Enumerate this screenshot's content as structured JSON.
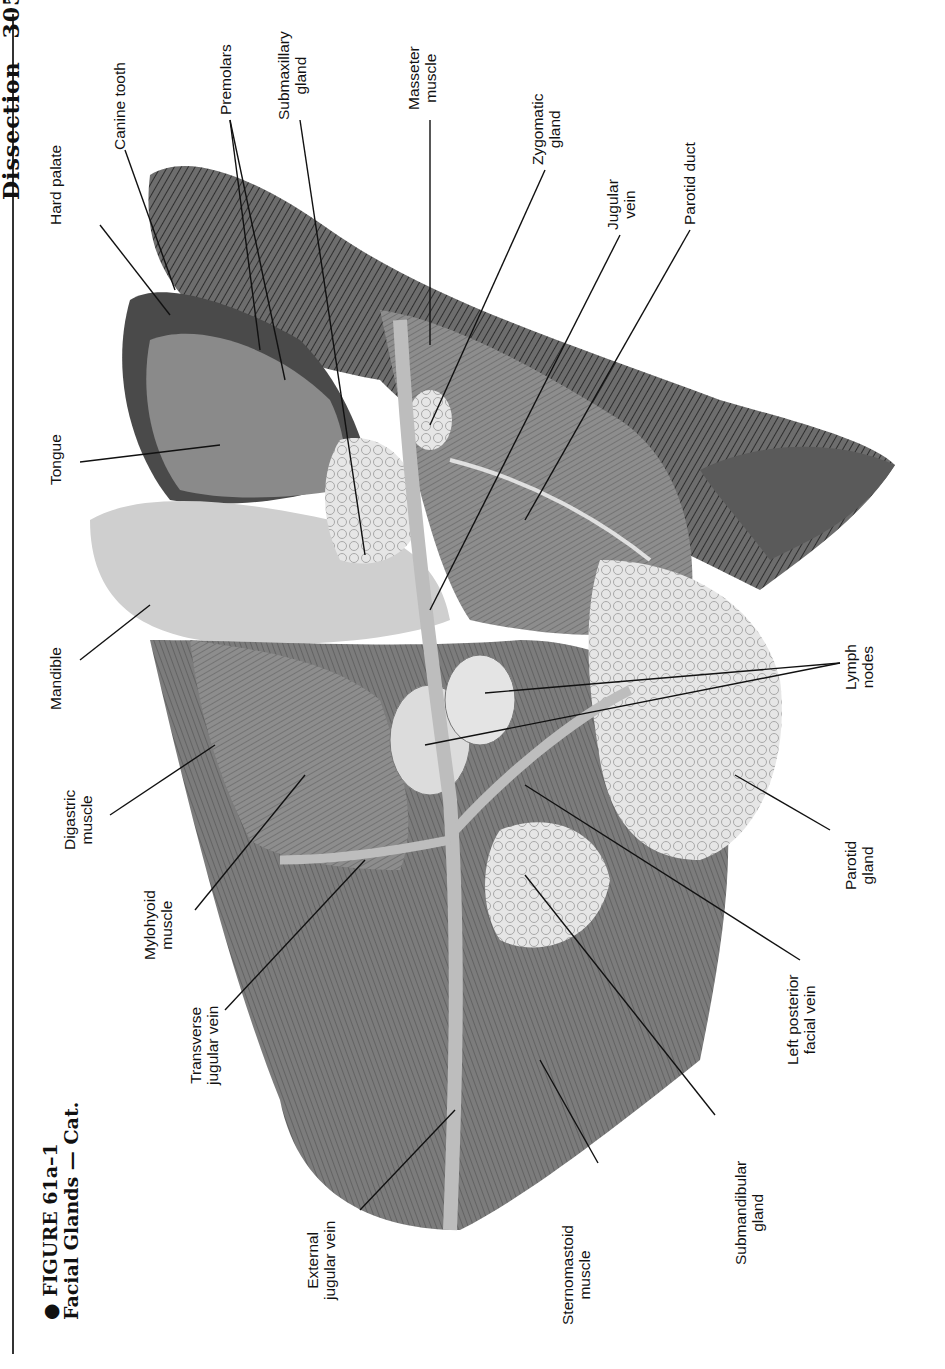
{
  "page": {
    "running_head": "Dissection",
    "page_number": "305"
  },
  "figure": {
    "number": "FIGURE 61a–1",
    "title": "Facial Glands — Cat."
  },
  "labels": [
    {
      "id": "hard-palate",
      "lines": [
        "Hard palate"
      ]
    },
    {
      "id": "canine-tooth",
      "lines": [
        "Canine tooth"
      ]
    },
    {
      "id": "premolars",
      "lines": [
        "Premolars"
      ]
    },
    {
      "id": "submaxillary-gland",
      "lines": [
        "Submaxillary",
        "gland"
      ]
    },
    {
      "id": "masseter-muscle",
      "lines": [
        "Masseter",
        "muscle"
      ]
    },
    {
      "id": "zygomatic-gland",
      "lines": [
        "Zygomatic",
        "gland"
      ]
    },
    {
      "id": "jugular-vein",
      "lines": [
        "Jugular",
        "vein"
      ]
    },
    {
      "id": "parotid-duct",
      "lines": [
        "Parotid duct"
      ]
    },
    {
      "id": "tongue",
      "lines": [
        "Tongue"
      ]
    },
    {
      "id": "mandible",
      "lines": [
        "Mandible"
      ]
    },
    {
      "id": "digastric-muscle",
      "lines": [
        "Digastric",
        "muscle"
      ]
    },
    {
      "id": "mylohyoid-muscle",
      "lines": [
        "Mylohyoid",
        "muscle"
      ]
    },
    {
      "id": "transverse-jugular-vein",
      "lines": [
        "Transverse",
        "jugular vein"
      ]
    },
    {
      "id": "external-jugular-vein",
      "lines": [
        "External",
        "jugular vein"
      ]
    },
    {
      "id": "sternomastoid-muscle",
      "lines": [
        "Sternomastoid",
        "muscle"
      ]
    },
    {
      "id": "submandibular-gland",
      "lines": [
        "Submandibular",
        "gland"
      ]
    },
    {
      "id": "left-posterior-facial-vein",
      "lines": [
        "Left posterior",
        "facial vein"
      ]
    },
    {
      "id": "parotid-gland",
      "lines": [
        "Parotid",
        "gland"
      ]
    },
    {
      "id": "lymph-nodes",
      "lines": [
        "Lymph",
        "nodes"
      ]
    }
  ]
}
